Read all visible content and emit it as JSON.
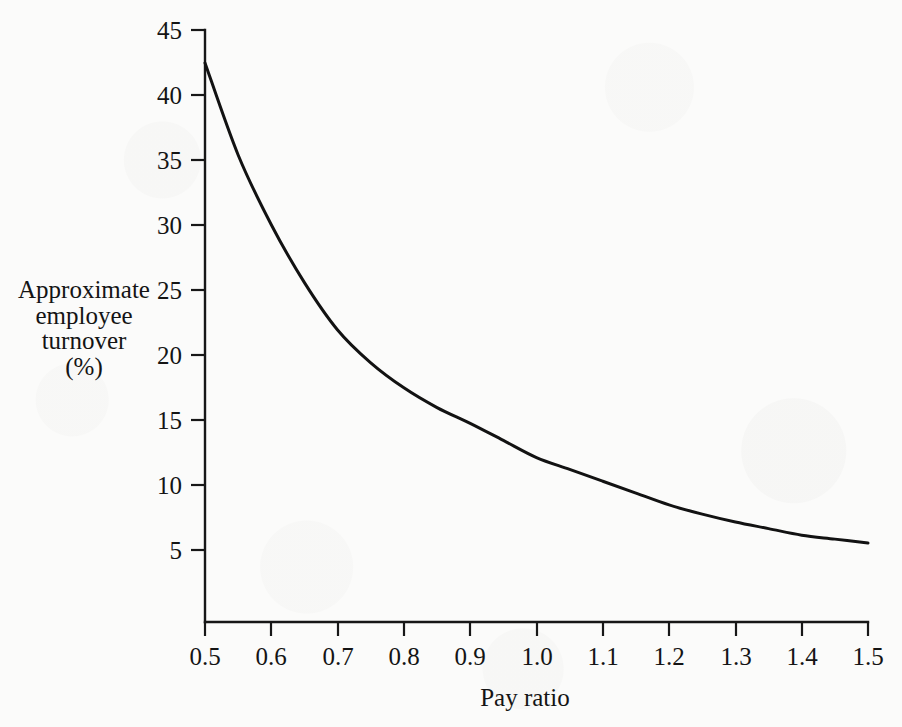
{
  "figure": {
    "background_color": "#fbfbfa",
    "ink_color": "#141414"
  },
  "axis_titles": {
    "x": "Pay ratio",
    "y_lines": [
      "Approximate",
      "employee",
      "turnover",
      "(%)"
    ]
  },
  "chart_data": {
    "type": "line",
    "title": "",
    "xlabel": "Pay ratio",
    "ylabel": "Approximate employee turnover (%)",
    "xlim": [
      0.5,
      1.5
    ],
    "ylim": [
      0,
      45
    ],
    "grid": false,
    "legend": null,
    "xticks": [
      "0.5",
      "0.6",
      "0.7",
      "0.8",
      "0.9",
      "1.0",
      "1.1",
      "1.2",
      "1.3",
      "1.4",
      "1.5"
    ],
    "xtick_values": [
      0.5,
      0.6,
      0.7,
      0.8,
      0.9,
      1.0,
      1.1,
      1.2,
      1.3,
      1.4,
      1.5
    ],
    "yticks": [
      "5",
      "10",
      "15",
      "20",
      "25",
      "30",
      "35",
      "40",
      "45"
    ],
    "ytick_values": [
      5,
      10,
      15,
      20,
      25,
      30,
      35,
      40,
      45
    ],
    "series": [
      {
        "name": "Approximate employee turnover",
        "color": "#121212",
        "x": [
          0.5,
          0.55,
          0.6,
          0.65,
          0.7,
          0.75,
          0.8,
          0.85,
          0.9,
          0.95,
          1.0,
          1.05,
          1.1,
          1.15,
          1.2,
          1.25,
          1.3,
          1.35,
          1.4,
          1.45,
          1.5
        ],
        "values": [
          42.5,
          35.5,
          30.2,
          25.8,
          22.2,
          19.7,
          17.8,
          16.3,
          15.1,
          13.8,
          12.5,
          11.6,
          10.7,
          9.8,
          8.9,
          8.2,
          7.6,
          7.1,
          6.6,
          6.3,
          6.0
        ]
      }
    ]
  }
}
